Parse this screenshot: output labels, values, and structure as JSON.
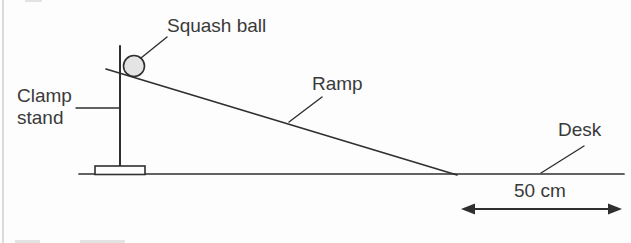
{
  "figure": {
    "type": "physics-apparatus-diagram",
    "labels": {
      "squash_ball": "Squash ball",
      "clamp_stand": "Clamp\nstand",
      "ramp": "Ramp",
      "desk": "Desk",
      "distance": "50 cm"
    },
    "colors": {
      "line": "#2f2f2f",
      "text": "#3a3a3a",
      "ball_fill": "#e4e4e4",
      "background": "#fdfdfd"
    }
  }
}
